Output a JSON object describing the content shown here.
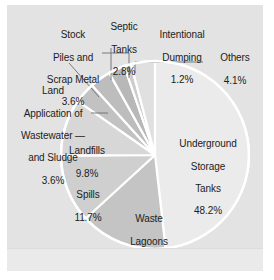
{
  "figure": {
    "background_color": "#e3e3e3",
    "page_color": "#ffffff",
    "separator_color": "#ffffff",
    "text_color": "#1c1c1c",
    "leader_line_color": "#6e6e6e"
  },
  "chart_data": {
    "type": "pie",
    "title": "",
    "subtitle": "",
    "xlabel": "",
    "ylabel": "",
    "legend_position": "none",
    "grid": false,
    "start_angle_deg": 0,
    "direction": "clockwise",
    "units": "percent",
    "categories": [
      "Underground Storage Tanks",
      "Waste Lagoons",
      "Spills",
      "Landfills",
      "Land Application of Wastewater and Sludge",
      "Stock Piles and Scrap Metal",
      "Septic Tanks",
      "Intentional Dumping",
      "Others"
    ],
    "values": [
      48.2,
      15,
      11.7,
      9.8,
      3.6,
      3.6,
      2.8,
      1.2,
      4.1
    ],
    "value_labels": [
      "48.2%",
      "15%",
      "11.7%",
      "9.8%",
      "3.6%",
      "3.6%",
      "2.8%",
      "1.2%",
      "4.1%"
    ],
    "slice_colors": [
      "#ebebeb",
      "#c4c4c4",
      "#cfcfcf",
      "#d7d7d7",
      "#c2c2c2",
      "#bdbdbd",
      "#b8b8b8",
      "#cdcdcd",
      "#e0e0e0"
    ],
    "slices": [
      {
        "name": "Underground Storage Tanks",
        "value": 48.2,
        "label": "Underground\nStorage\nTanks\n48.2%",
        "color": "#ebebeb",
        "label_placement": "inside"
      },
      {
        "name": "Waste Lagoons",
        "value": 15,
        "label": "Waste\nLagoons\n15%",
        "color": "#c4c4c4",
        "label_placement": "inside"
      },
      {
        "name": "Spills",
        "value": 11.7,
        "label": "Spills\n11.7%",
        "color": "#cfcfcf",
        "label_placement": "inside"
      },
      {
        "name": "Landfills",
        "value": 9.8,
        "label": "Landfills\n9.8%",
        "color": "#d7d7d7",
        "label_placement": "inside"
      },
      {
        "name": "Land Application of Wastewater and Sludge",
        "value": 3.6,
        "label": "Land\nApplication of\nWastewater —\nand Sludge\n3.6%",
        "color": "#c2c2c2",
        "label_placement": "outside-left"
      },
      {
        "name": "Stock Piles and Scrap Metal",
        "value": 3.6,
        "label": "Stock\nPiles and\nScrap Metal\n3.6%",
        "color": "#bdbdbd",
        "label_placement": "outside-top-left"
      },
      {
        "name": "Septic Tanks",
        "value": 2.8,
        "label": "Septic\nTanks\n2.8%",
        "color": "#b8b8b8",
        "label_placement": "outside-top"
      },
      {
        "name": "Intentional Dumping",
        "value": 1.2,
        "label": "Intentional\nDumping\n1.2%",
        "color": "#cdcdcd",
        "label_placement": "outside-top-right"
      },
      {
        "name": "Others",
        "value": 4.1,
        "label": "Others\n4.1%",
        "color": "#e0e0e0",
        "label_placement": "outside-right"
      }
    ]
  },
  "labels": {
    "underground_storage_tanks": {
      "l1": "Underground",
      "l2": "Storage",
      "l3": "Tanks",
      "l4": "48.2%"
    },
    "waste_lagoons": {
      "l1": "Waste",
      "l2": "Lagoons",
      "l3": "15%"
    },
    "spills": {
      "l1": "Spills",
      "l2": "11.7%"
    },
    "landfills": {
      "l1": "Landfills",
      "l2": "9.8%"
    },
    "land_application": {
      "l1": "Land",
      "l2": "Application of",
      "l3": "Wastewater —",
      "l4": "and Sludge",
      "l5": "3.6%"
    },
    "stock_piles": {
      "l1": "Stock",
      "l2": "Piles and",
      "l3": "Scrap Metal",
      "l4": "3.6%"
    },
    "septic_tanks": {
      "l1": "Septic",
      "l2": "Tanks",
      "l3": "2.8%"
    },
    "intentional_dumping": {
      "l1": "Intentional",
      "l2": "Dumping",
      "l3": "1.2%"
    },
    "others": {
      "l1": "Others",
      "l2": "4.1%"
    }
  }
}
